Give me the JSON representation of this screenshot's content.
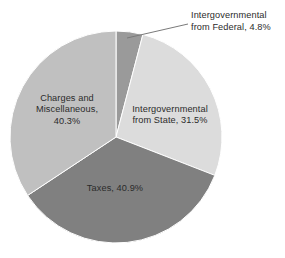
{
  "chart_data": {
    "type": "pie",
    "title": "",
    "subtitle": "",
    "xlabel": "",
    "ylabel": "",
    "legend_position": "none",
    "grid": false,
    "units": "percent",
    "start_angle_deg": 0,
    "direction": "clockwise",
    "categories": [
      "Intergovernmental from Federal",
      "Intergovernmental from State",
      "Taxes",
      "Charges and Miscellaneous"
    ],
    "values": [
      4.8,
      31.5,
      40.9,
      40.3
    ],
    "colors": [
      "#9a9a9a",
      "#dcdcdc",
      "#808080",
      "#c0c0c0"
    ],
    "slices": [
      {
        "name": "Intergovernmental from Federal",
        "value": 4.8,
        "value_label": "4.8%",
        "color": "#9a9a9a",
        "label_placement": "callout",
        "label_lines": [
          "Intergovernmental",
          "from Federal, 4.8%"
        ]
      },
      {
        "name": "Intergovernmental from State",
        "value": 31.5,
        "value_label": "31.5%",
        "color": "#dcdcdc",
        "label_placement": "inside",
        "label_lines": [
          "Intergovernmental",
          "from State, 31.5%"
        ]
      },
      {
        "name": "Taxes",
        "value": 40.9,
        "value_label": "40.9%",
        "color": "#808080",
        "label_placement": "inside",
        "label_lines": [
          "Taxes, 40.9%"
        ]
      },
      {
        "name": "Charges and Miscellaneous",
        "value": 40.3,
        "value_label": "40.3%",
        "color": "#c0c0c0",
        "label_placement": "inside",
        "label_lines": [
          "Charges and",
          "Miscellaneous,",
          "40.3%"
        ]
      }
    ]
  },
  "labels": {
    "federal_line1": "Intergovernmental",
    "federal_line2": "from Federal, 4.8%",
    "state_line1": "Intergovernmental",
    "state_line2": "from State, 31.5%",
    "taxes_line1": "Taxes, 40.9%",
    "charges_line1": "Charges and",
    "charges_line2": "Miscellaneous,",
    "charges_line3": "40.3%"
  },
  "style": {
    "background": "#ffffff",
    "text_color": "#2b2b2b",
    "leader_line_color": "#7a7a7a",
    "slice_edge_color": "#ffffff"
  },
  "geometry": {
    "center_x": 116,
    "center_y": 137,
    "radius": 106
  }
}
